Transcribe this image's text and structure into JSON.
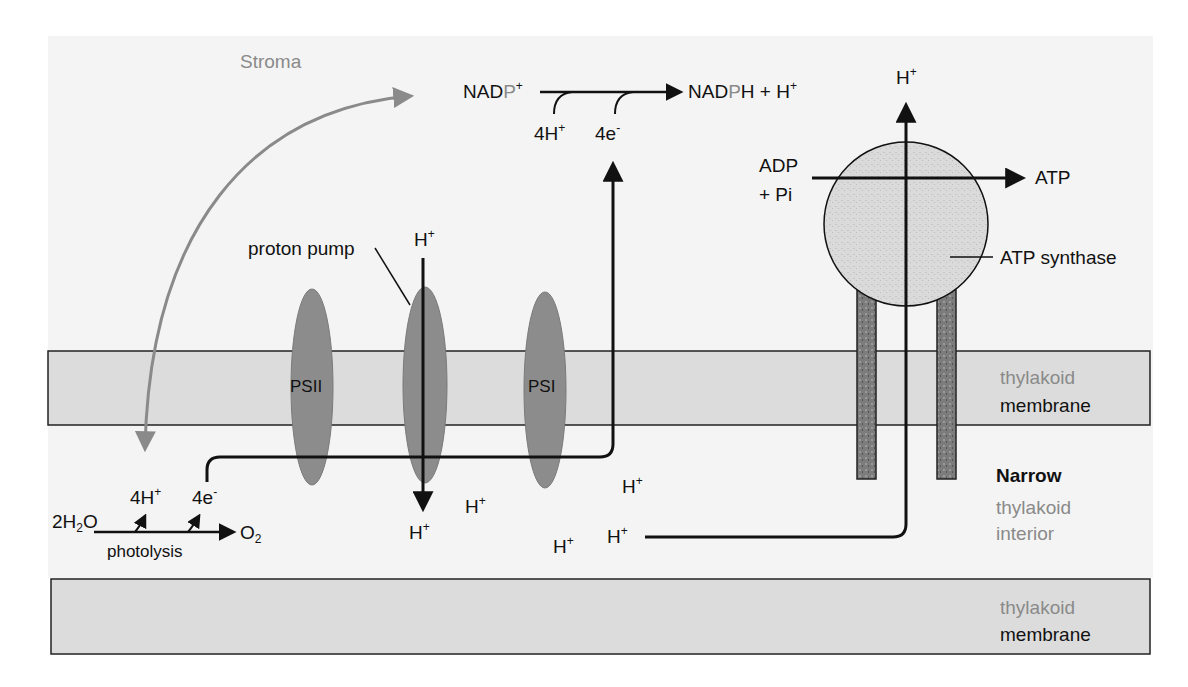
{
  "diagram": {
    "colors": {
      "background": "#f4f4f4",
      "membrane": "#dcdcdc",
      "complex": "#8c8c8c",
      "stroma_arrow": "#8a8a8a",
      "line": "#111111",
      "atp_synthase_head": "#d8d8d8",
      "atp_synthase_stalk": "#7a7a7a"
    },
    "regions": {
      "stroma": "Stroma",
      "membrane_top_line1": "thylakoid",
      "membrane_top_line2": "membrane",
      "interior_line1": "Narrow",
      "interior_line2": "thylakoid",
      "interior_line3": "interior",
      "membrane_bottom_line1": "thylakoid",
      "membrane_bottom_line2": "membrane"
    },
    "complexes": {
      "psii": "PSII",
      "proton_pump_label": "proton pump",
      "psi": "PSI",
      "atp_synthase": "ATP synthase"
    },
    "nadp": {
      "reactant_a": "NAD",
      "reactant_p": "P",
      "reactant_sup": "+",
      "product_a": "NAD",
      "product_p": "P",
      "product_b": "H + H",
      "product_sup": "+",
      "input_protons": "4H",
      "input_protons_sup": "+",
      "input_electrons": "4e",
      "input_electrons_sup": "-"
    },
    "photolysis": {
      "water_a": "2H",
      "water_sub": "2",
      "water_b": "O",
      "protons": "4H",
      "protons_sup": "+",
      "electrons": "4e",
      "electrons_sup": "-",
      "oxygen": "O",
      "oxygen_sub": "2",
      "label": "photolysis"
    },
    "atp": {
      "adp_line1": "ADP",
      "adp_line2": "+ Pi",
      "product": "ATP",
      "proton_out": "H",
      "proton_sup": "+"
    },
    "protons": {
      "symbol": "H",
      "sup": "+"
    }
  }
}
